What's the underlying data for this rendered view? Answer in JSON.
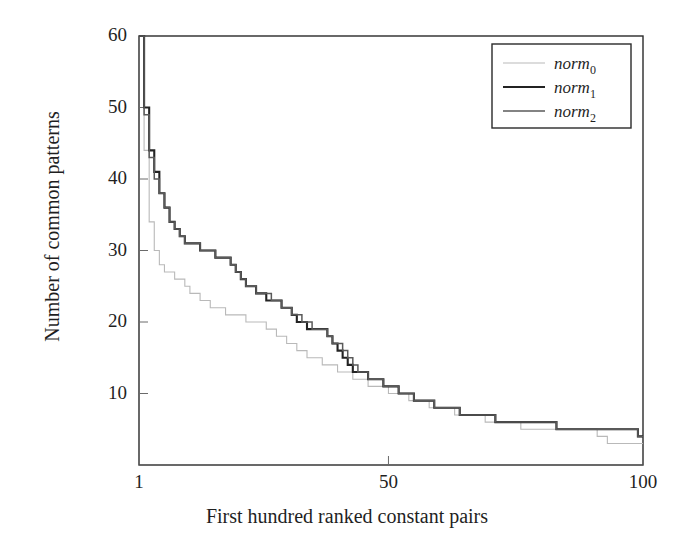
{
  "chart_data": {
    "type": "line",
    "title": "",
    "xlabel": "First hundred ranked constant pairs",
    "ylabel": "Number of common patterns",
    "xlim": [
      1,
      100
    ],
    "ylim": [
      0,
      60
    ],
    "xticks": [
      "1",
      "50",
      "100"
    ],
    "xtick_values": [
      1,
      50,
      100
    ],
    "yticks": [
      "10",
      "20",
      "30",
      "40",
      "50",
      "60"
    ],
    "ytick_values": [
      10,
      20,
      30,
      40,
      50,
      60
    ],
    "grid": false,
    "legend_position": "top-right",
    "x": [
      1,
      2,
      3,
      4,
      5,
      6,
      7,
      8,
      9,
      10,
      11,
      12,
      13,
      14,
      15,
      16,
      17,
      18,
      19,
      20,
      21,
      22,
      23,
      24,
      25,
      26,
      27,
      28,
      29,
      30,
      31,
      32,
      33,
      34,
      35,
      36,
      37,
      38,
      39,
      40,
      41,
      42,
      43,
      44,
      45,
      46,
      47,
      48,
      49,
      50,
      51,
      52,
      53,
      54,
      55,
      56,
      57,
      58,
      59,
      60,
      61,
      62,
      63,
      64,
      65,
      66,
      67,
      68,
      69,
      70,
      71,
      72,
      73,
      74,
      75,
      76,
      77,
      78,
      79,
      80,
      81,
      82,
      83,
      84,
      85,
      86,
      87,
      88,
      89,
      90,
      91,
      92,
      93,
      94,
      95,
      96,
      97,
      98,
      99,
      100
    ],
    "series": [
      {
        "name": "norm_0",
        "label": "norm",
        "sublabel": "0",
        "color": "#b9b9b9",
        "width": 1.1,
        "values": [
          60,
          44,
          34,
          30,
          28,
          27,
          27,
          26,
          26,
          25,
          24,
          24,
          23,
          23,
          22,
          22,
          22,
          21,
          21,
          21,
          21,
          20,
          20,
          20,
          20,
          19,
          19,
          18,
          18,
          17,
          17,
          16,
          16,
          15,
          15,
          15,
          14,
          14,
          14,
          13,
          13,
          13,
          12,
          12,
          12,
          11,
          11,
          11,
          11,
          10,
          10,
          10,
          10,
          9,
          9,
          9,
          9,
          8,
          8,
          8,
          8,
          8,
          7,
          7,
          7,
          7,
          7,
          7,
          6,
          6,
          6,
          6,
          6,
          6,
          6,
          5,
          5,
          5,
          5,
          5,
          5,
          5,
          5,
          5,
          5,
          5,
          5,
          5,
          5,
          5,
          4,
          4,
          3,
          3,
          3,
          3,
          3,
          3,
          3,
          3
        ]
      },
      {
        "name": "norm_1",
        "label": "norm",
        "sublabel": "1",
        "color": "#232323",
        "width": 2.1,
        "values": [
          60,
          50,
          44,
          41,
          38,
          36,
          34,
          33,
          32,
          31,
          31,
          31,
          30,
          30,
          30,
          29,
          29,
          29,
          28,
          27,
          26,
          25,
          25,
          24,
          24,
          23,
          23,
          23,
          22,
          22,
          21,
          20,
          20,
          19,
          19,
          19,
          19,
          18,
          17,
          16,
          15,
          14,
          13,
          13,
          13,
          12,
          12,
          12,
          11,
          11,
          11,
          10,
          10,
          10,
          9,
          9,
          9,
          9,
          8,
          8,
          8,
          8,
          8,
          7,
          7,
          7,
          7,
          7,
          7,
          7,
          6,
          6,
          6,
          6,
          6,
          6,
          6,
          6,
          6,
          6,
          6,
          6,
          5,
          5,
          5,
          5,
          5,
          5,
          5,
          5,
          5,
          5,
          5,
          5,
          5,
          5,
          5,
          5,
          4,
          4
        ]
      },
      {
        "name": "norm_2",
        "label": "norm",
        "sublabel": "2",
        "color": "#5a5a5a",
        "width": 1.5,
        "values": [
          60,
          49,
          43,
          40,
          38,
          36,
          34,
          33,
          32,
          31,
          31,
          31,
          30,
          30,
          30,
          29,
          29,
          29,
          28,
          27,
          26,
          25,
          25,
          24,
          24,
          24,
          23,
          23,
          22,
          22,
          21,
          21,
          20,
          20,
          19,
          19,
          19,
          18,
          17,
          17,
          16,
          15,
          14,
          13,
          13,
          12,
          12,
          12,
          11,
          11,
          11,
          10,
          10,
          10,
          9,
          9,
          9,
          9,
          8,
          8,
          8,
          8,
          8,
          7,
          7,
          7,
          7,
          7,
          7,
          7,
          6,
          6,
          6,
          6,
          6,
          6,
          6,
          6,
          6,
          6,
          6,
          6,
          5,
          5,
          5,
          5,
          5,
          5,
          5,
          5,
          5,
          5,
          5,
          5,
          5,
          5,
          5,
          5,
          4,
          4
        ]
      }
    ]
  },
  "axes": {
    "frame_color": "#2a2a2a"
  }
}
